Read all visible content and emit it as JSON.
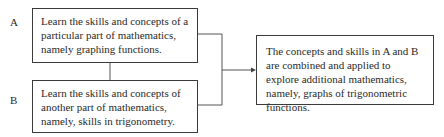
{
  "diagram": {
    "nodes": [
      {
        "id": "A",
        "label": "A",
        "text": "Learn the skills and concepts of a particular part of mathematics, namely graphing functions."
      },
      {
        "id": "B",
        "label": "B",
        "text": "Learn the skills and concepts of another part of mathematics, namely, skills in trigonometry."
      },
      {
        "id": "C",
        "text": "The concepts and skills in A and B are combined and applied to explore additional mathematics, namely, graphs of trigonometric functions."
      }
    ],
    "edges": [
      {
        "from": "A",
        "to": "B",
        "type": "line"
      },
      {
        "from": "A",
        "to": "C",
        "type": "arrow"
      },
      {
        "from": "B",
        "to": "C",
        "type": "arrow"
      }
    ],
    "colors": {
      "stroke": "#3a3a3a",
      "text": "#2a2a2a",
      "background": "#ffffff"
    }
  }
}
